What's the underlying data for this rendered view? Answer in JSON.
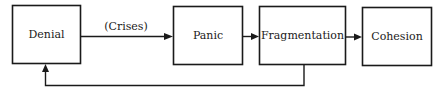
{
  "diagram": {
    "type": "flow",
    "nodes": [
      {
        "id": "denial",
        "label": "Denial"
      },
      {
        "id": "panic",
        "label": "Panic"
      },
      {
        "id": "fragmentation",
        "label": "Fragmentation"
      },
      {
        "id": "cohesion",
        "label": "Cohesion"
      }
    ],
    "edges": [
      {
        "from": "denial",
        "to": "panic",
        "label": "(Crises)"
      },
      {
        "from": "panic",
        "to": "fragmentation",
        "label": ""
      },
      {
        "from": "fragmentation",
        "to": "cohesion",
        "label": ""
      },
      {
        "from": "fragmentation",
        "to": "denial",
        "label": "",
        "kind": "feedback"
      }
    ],
    "colors": {
      "stroke": "#1a1a1a",
      "background": "#ffffff"
    }
  }
}
